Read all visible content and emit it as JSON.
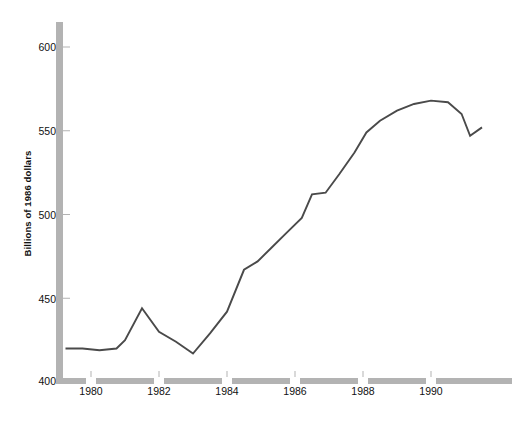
{
  "chart_data": {
    "type": "line",
    "title": "",
    "subtitle": "",
    "xlabel": "",
    "ylabel": "Billions of 1986 dollars",
    "ylim": [
      400,
      615
    ],
    "xlim": [
      1979.2,
      1991.6
    ],
    "ytick_labels": [
      "400",
      "450",
      "500",
      "550",
      "600"
    ],
    "ytick_values": [
      400,
      450,
      500,
      550,
      600
    ],
    "xtick_labels": [
      "1980",
      "1982",
      "1984",
      "1986",
      "1988",
      "1990"
    ],
    "xtick_values": [
      1980,
      1982,
      1984,
      1986,
      1988,
      1990
    ],
    "grid": false,
    "legend": false,
    "legend_position": "none",
    "axis_style": "thick-gray-bars-with-tick-gaps",
    "series": [
      {
        "name": "Series 1",
        "color": "#4a4a4a",
        "x": [
          1979.25,
          1979.75,
          1980.25,
          1980.75,
          1981.0,
          1981.5,
          1982.0,
          1982.5,
          1983.0,
          1983.5,
          1984.0,
          1984.5,
          1984.9,
          1985.3,
          1985.75,
          1986.2,
          1986.5,
          1986.9,
          1987.3,
          1987.75,
          1988.1,
          1988.5,
          1989.0,
          1989.5,
          1990.0,
          1990.5,
          1990.9,
          1991.15,
          1991.5
        ],
        "y": [
          420,
          420,
          419,
          420,
          425,
          444,
          430,
          424,
          417,
          429,
          442,
          467,
          472,
          480,
          489,
          498,
          512,
          513,
          524,
          537,
          549,
          556,
          562,
          566,
          568,
          567,
          560,
          547,
          552
        ]
      }
    ],
    "colors": {
      "line": "#4a4a4a",
      "axis": "#b3b3b3",
      "text": "#111111",
      "background": "#ffffff"
    }
  }
}
